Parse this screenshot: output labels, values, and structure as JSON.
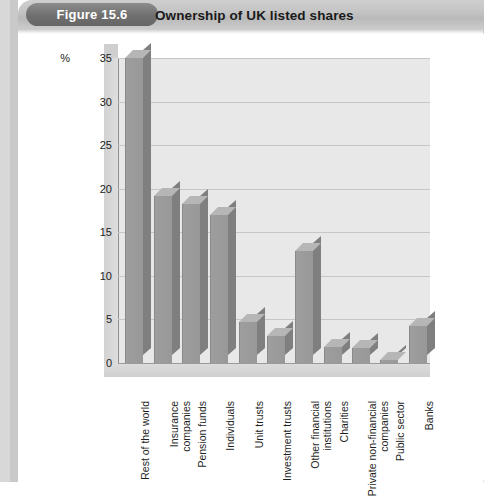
{
  "figure": {
    "number_label": "Figure 15.6",
    "title": "Ownership of UK listed shares"
  },
  "chart_data": {
    "type": "bar",
    "title": "Ownership of UK listed shares",
    "xlabel": "",
    "ylabel": "%",
    "unit_label": "%",
    "ylim": [
      0,
      35
    ],
    "ytick_step": 5,
    "yticks": [
      "0",
      "5",
      "10",
      "15",
      "20",
      "25",
      "30",
      "35"
    ],
    "grid": true,
    "legend": "none",
    "style": "3d-column",
    "bar_color": "#9a9a9a",
    "plot_background": "#e8e8e8",
    "categories": [
      "Rest of the world",
      "Insurance\ncompanies",
      "Pension funds",
      "Individuals",
      "Unit trusts",
      "Investment trusts",
      "Other financial\ninstitutions",
      "Charities",
      "Private non-financial\ncompanies",
      "Public sector",
      "Banks"
    ],
    "values": [
      35.0,
      19.2,
      18.3,
      17.0,
      4.7,
      3.1,
      12.8,
      1.8,
      1.7,
      0.3,
      4.2
    ]
  },
  "colors": {
    "header_band": "#c4c4c4",
    "pill": "#6f6f6f",
    "pill_text": "#ffffff",
    "title_text": "#1a1a1a",
    "gutter": "#d8d8d8"
  }
}
